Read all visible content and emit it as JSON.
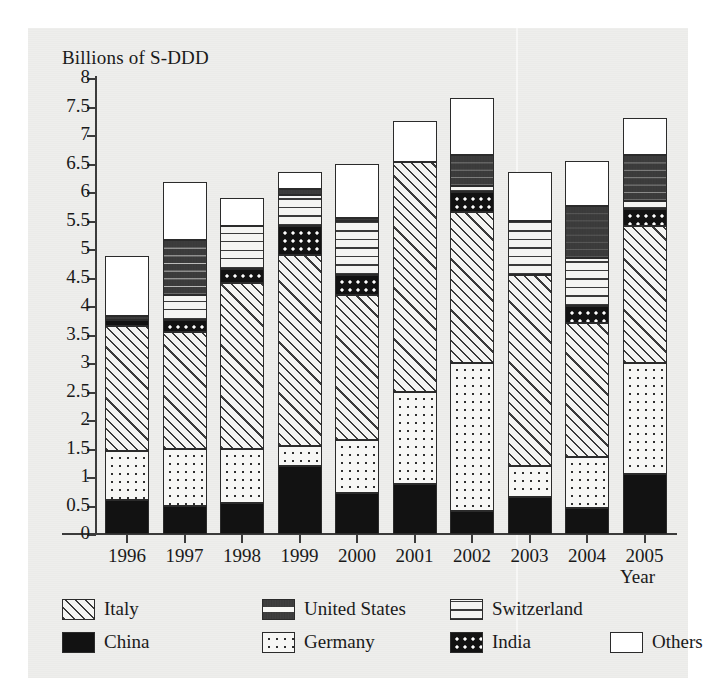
{
  "axis_title_y": "Billions of S-DDD",
  "axis_title_x": "Year",
  "y_ticks": [
    "0",
    "0.5",
    "1",
    "1.5",
    "2",
    "2.5",
    "3",
    "3.5",
    "4",
    "4.5",
    "5",
    "5.5",
    "6",
    "6.5",
    "7",
    "7.5",
    "8"
  ],
  "legend": {
    "row1": [
      {
        "label": "Italy",
        "pattern": "p-italy",
        "icon": "diagonal-hatch-swatch"
      },
      {
        "label": "United States",
        "pattern": "p-us",
        "icon": "vertical-dash-swatch"
      },
      {
        "label": "Switzerland",
        "pattern": "p-swiss",
        "icon": "horizontal-lines-swatch"
      }
    ],
    "row2": [
      {
        "label": "China",
        "pattern": "p-china",
        "icon": "solid-black-swatch"
      },
      {
        "label": "Germany",
        "pattern": "p-germany",
        "icon": "sparse-dots-swatch"
      },
      {
        "label": "India",
        "pattern": "p-india",
        "icon": "dense-dots-swatch"
      },
      {
        "label": "Others",
        "pattern": "p-others",
        "icon": "white-swatch"
      }
    ]
  },
  "chart_data": {
    "type": "bar",
    "subtype": "stacked-vertical",
    "title": "",
    "xlabel": "Year",
    "ylabel": "Billions of S-DDD",
    "ylim": [
      0,
      8
    ],
    "ytick_step": 0.5,
    "grid": false,
    "legend_position": "bottom",
    "categories": [
      "1996",
      "1997",
      "1998",
      "1999",
      "2000",
      "2001",
      "2002",
      "2003",
      "2004",
      "2005"
    ],
    "stack_order": [
      "China",
      "Germany",
      "Italy",
      "India",
      "Switzerland",
      "United States",
      "Others"
    ],
    "series": [
      {
        "name": "China",
        "pattern": "p-china",
        "values": [
          0.6,
          0.5,
          0.55,
          1.2,
          0.72,
          0.88,
          0.4,
          0.65,
          0.45,
          1.05
        ]
      },
      {
        "name": "Germany",
        "pattern": "p-germany",
        "values": [
          0.85,
          1.0,
          0.95,
          0.35,
          0.93,
          1.62,
          2.6,
          0.55,
          0.9,
          1.95
        ]
      },
      {
        "name": "Italy",
        "pattern": "p-italy",
        "values": [
          2.2,
          2.05,
          2.9,
          3.35,
          2.55,
          4.02,
          2.65,
          3.35,
          2.35,
          2.4
        ]
      },
      {
        "name": "India",
        "pattern": "p-india",
        "values": [
          0.1,
          0.2,
          0.25,
          0.5,
          0.35,
          0.0,
          0.35,
          0.0,
          0.3,
          0.3
        ]
      },
      {
        "name": "Switzerland",
        "pattern": "p-swiss",
        "values": [
          0.0,
          0.45,
          0.75,
          0.55,
          0.95,
          0.0,
          0.1,
          0.95,
          0.85,
          0.15
        ]
      },
      {
        "name": "United States",
        "pattern": "p-us",
        "values": [
          0.07,
          0.95,
          0.0,
          0.1,
          0.05,
          0.0,
          0.55,
          0.0,
          0.9,
          0.8
        ]
      },
      {
        "name": "Others",
        "pattern": "p-others",
        "values": [
          1.05,
          1.02,
          0.5,
          0.3,
          0.95,
          0.73,
          1.0,
          0.85,
          0.8,
          0.65
        ]
      }
    ],
    "totals": [
      4.87,
      6.17,
      5.9,
      6.35,
      6.5,
      7.25,
      7.65,
      6.35,
      6.55,
      7.3
    ],
    "bar_labels_visible": false
  }
}
